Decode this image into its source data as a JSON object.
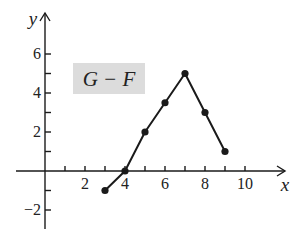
{
  "chart_data": {
    "type": "line",
    "title": "",
    "annotation": {
      "text": "G − F",
      "box_fill": "#dcdcdc",
      "x_px": 73,
      "y_px": 63,
      "w_px": 72,
      "h_px": 31
    },
    "xlabel": "x",
    "ylabel": "y",
    "series": [
      {
        "name": "G − F",
        "color": "#1a1a1a",
        "marker": "circle",
        "x": [
          3,
          4,
          5,
          6,
          7,
          8,
          9
        ],
        "y": [
          -1,
          0,
          2,
          3.5,
          5,
          3,
          1
        ]
      }
    ],
    "xticks": [
      2,
      4,
      6,
      8,
      10
    ],
    "xtick_labels": [
      "2",
      "4",
      "6",
      "8",
      "10"
    ],
    "xminor_ticks": [
      1,
      2,
      3,
      4,
      5,
      6,
      7,
      8,
      9,
      10
    ],
    "yticks": [
      -2,
      2,
      4,
      6
    ],
    "ytick_labels": [
      "−2",
      "2",
      "4",
      "6"
    ],
    "yminor_ticks": [
      -2,
      -1,
      1,
      2,
      3,
      4,
      5,
      6
    ],
    "xlim": [
      -1.5,
      12
    ],
    "ylim": [
      -3,
      8
    ],
    "grid": false,
    "legend": "none"
  }
}
